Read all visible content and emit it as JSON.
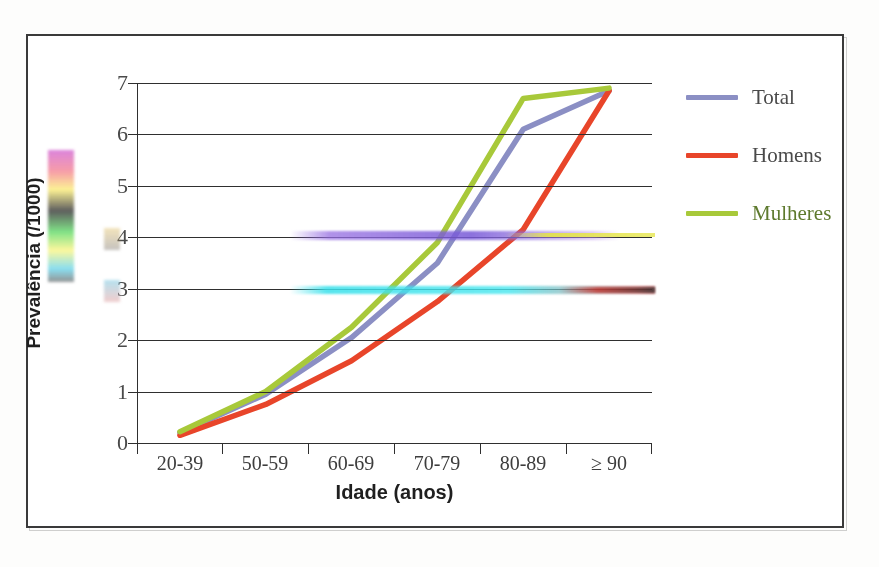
{
  "figure": {
    "frame_border_color": "#3a3a3a",
    "background": "#ffffff"
  },
  "chart_data": {
    "type": "line",
    "title": "",
    "xlabel": "Idade (anos)",
    "ylabel": "Prevalência (/1000)",
    "categories": [
      "20-39",
      "50-59",
      "60-69",
      "70-79",
      "80-89",
      "≥ 90"
    ],
    "ylim": [
      0,
      7
    ],
    "yticks": [
      0,
      1,
      2,
      3,
      4,
      5,
      6,
      7
    ],
    "ytick_labels": [
      "0",
      "1",
      "2",
      "3",
      "4",
      "5",
      "6",
      "7"
    ],
    "grid": "horizontal",
    "legend_position": "right",
    "series": [
      {
        "name": "Total",
        "color": "#8b8fc4",
        "values": [
          0.2,
          0.95,
          2.05,
          3.5,
          6.1,
          6.85
        ]
      },
      {
        "name": "Homens",
        "color": "#e8452a",
        "values": [
          0.15,
          0.75,
          1.6,
          2.75,
          4.15,
          6.85
        ]
      },
      {
        "name": "Mulheres",
        "color": "#a8c93a",
        "values": [
          0.22,
          1.0,
          2.25,
          3.9,
          6.7,
          6.9
        ]
      }
    ]
  },
  "legend": {
    "items": [
      {
        "label": "Total",
        "color": "#8b8fc4"
      },
      {
        "label": "Homens",
        "color": "#e8452a"
      },
      {
        "label": "Mulheres",
        "color": "#a8c93a"
      }
    ]
  },
  "artifacts": {
    "note": "horizontal scan-corruption bands overlay the plot",
    "colors": [
      "#9a6ee1",
      "#e4e446",
      "#3ce1eb",
      "#be3c3c"
    ]
  }
}
